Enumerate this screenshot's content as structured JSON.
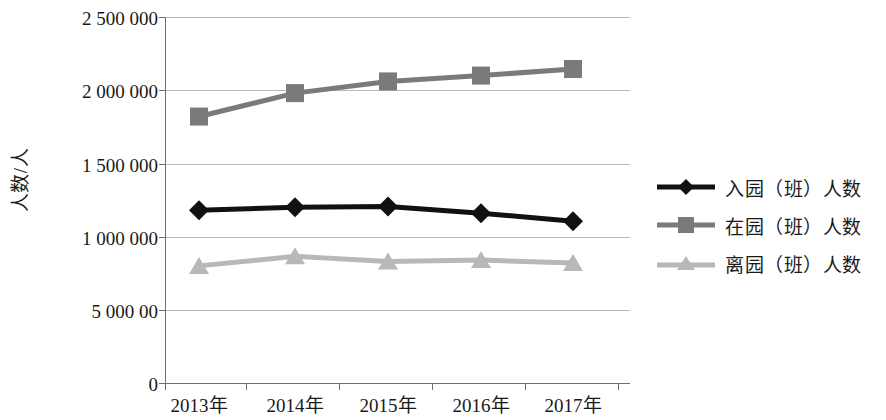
{
  "chart_data": {
    "type": "line",
    "title": "",
    "xlabel": "",
    "ylabel": "人数/人",
    "categories": [
      "2013年",
      "2014年",
      "2015年",
      "2016年",
      "2017年"
    ],
    "ytick_labels": [
      "2 500 000",
      "2 000 000",
      "1 500 000",
      "1 000 000",
      "5 000 00",
      "0"
    ],
    "ytick_values": [
      2500000,
      2000000,
      1500000,
      1000000,
      500000,
      0
    ],
    "ylim": [
      0,
      2500000
    ],
    "grid": true,
    "legend_position": "right",
    "series": [
      {
        "name": "入园（班）人数",
        "marker": "diamond",
        "color": "#111111",
        "values": [
          1180000,
          1200000,
          1205000,
          1160000,
          1105000
        ]
      },
      {
        "name": "在园（班）人数",
        "marker": "square",
        "color": "#7a7a7a",
        "values": [
          1820000,
          1980000,
          2060000,
          2100000,
          2145000
        ]
      },
      {
        "name": "离园（班）人数",
        "marker": "triangle",
        "color": "#b8b8b8",
        "values": [
          800000,
          865000,
          830000,
          840000,
          820000
        ]
      }
    ]
  },
  "axis": {
    "grid_color": "#b9b9b9",
    "axis_color": "#6f6f6f"
  }
}
